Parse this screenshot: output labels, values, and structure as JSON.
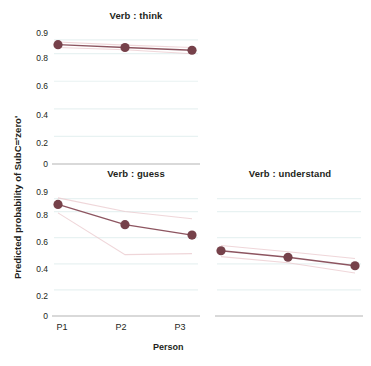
{
  "chart_data": {
    "type": "line",
    "title": "",
    "xlabel": "Person",
    "ylabel": "Predicted probability of SubC='zero'",
    "categories": [
      "P1",
      "P2",
      "P3"
    ],
    "ytick_labels": [
      "0",
      "0.2",
      "0.4",
      "0.6",
      "0.8",
      "0.9"
    ],
    "ytick_values": [
      0,
      0.2,
      0.4,
      0.6,
      0.8,
      0.9
    ],
    "ylim": [
      0,
      0.95
    ],
    "grid": true,
    "grid_color": "#e8f2f2",
    "legend": "none",
    "marker_color": "#76414a",
    "line_color": "#8d5560",
    "band_color": "#e9c8cc",
    "facets": [
      {
        "name": "think",
        "title": "Verb : think",
        "values": [
          0.865,
          0.845,
          0.825
        ],
        "band_upper": [
          0.885,
          0.862,
          0.845
        ],
        "band_lower": [
          0.845,
          0.828,
          0.8
        ]
      },
      {
        "name": "guess",
        "title": "Verb : guess",
        "values": [
          0.855,
          0.7,
          0.62
        ],
        "band_upper": [
          0.905,
          0.8,
          0.745
        ],
        "band_lower": [
          0.79,
          0.47,
          0.478
        ]
      },
      {
        "name": "understand",
        "title": "Verb : understand",
        "values": [
          0.5,
          0.45,
          0.385
        ],
        "band_upper": [
          0.54,
          0.492,
          0.44
        ],
        "band_lower": [
          0.455,
          0.408,
          0.33
        ]
      }
    ]
  },
  "panels": {
    "think": {
      "title": "Verb : think"
    },
    "guess": {
      "title": "Verb : guess"
    },
    "understand": {
      "title": "Verb : understand"
    }
  },
  "axes": {
    "y_title": "Predicted probability of SubC='zero'",
    "x_title": "Person",
    "y_ticks_top": [
      "0.9",
      "0.8",
      "0.6",
      "0.4",
      "0.2",
      "0"
    ],
    "y_ticks_bottom": [
      "0.9",
      "0.8",
      "0.6",
      "0.4",
      "0.2",
      "0"
    ],
    "x_ticks": [
      "P1",
      "P2",
      "P3"
    ]
  }
}
